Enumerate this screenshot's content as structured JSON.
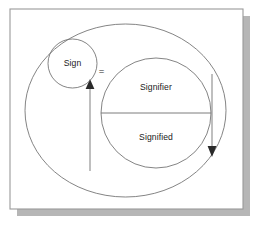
{
  "figure": {
    "background_color": "#ffffff",
    "panel_color": "#ffffff",
    "frame_color": "#9a9a9a",
    "shadow_color": "#b6b6b6",
    "stroke_color": "#6e6e6e",
    "text_color": "#1a1a1a",
    "arrow_color": "#8a8a8a",
    "arrowhead_color": "#2a2a2a"
  },
  "labels": {
    "sign": "Sign",
    "equals": "=",
    "signifier": "Signifier",
    "signified": "Signified"
  },
  "shapes": {
    "outer_ellipse": {
      "name": "outer-boundary-ellipse",
      "cx": 125.5,
      "cy": 110.5,
      "rx": 100.5,
      "ry": 86.5
    },
    "sign_circle": {
      "name": "sign-circle",
      "cx": 72.5,
      "cy": 63.5,
      "r": 24.5
    },
    "sign_system_circle": {
      "name": "sign-system-circle",
      "cx": 156,
      "cy": 113,
      "r": 55
    },
    "divider_line": {
      "name": "signifier-signified-divider",
      "x1": 101,
      "y1": 113,
      "x2": 211,
      "y2": 113
    }
  },
  "arrows": {
    "up": {
      "name": "upward-arrow",
      "x": 90,
      "y_start": 171,
      "y_end": 83,
      "direction": "up"
    },
    "down": {
      "name": "downward-arrow",
      "x": 212,
      "y_start": 74,
      "y_end": 153,
      "direction": "down"
    }
  },
  "frame": {
    "x": 10,
    "y": 9,
    "width": 233,
    "height": 200,
    "shadow_offset_x": 7,
    "shadow_offset_y": 7
  }
}
